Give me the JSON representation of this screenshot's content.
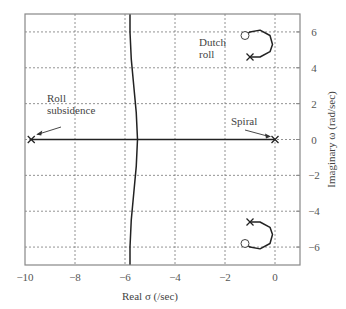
{
  "chart_data": {
    "type": "line",
    "title": "",
    "xlabel": "Real σ (/sec)",
    "ylabel": "Imaginary ω (rad/sec)",
    "xlim": [
      -10,
      1
    ],
    "ylim": [
      -7,
      7
    ],
    "grid": true,
    "x_ticks": [
      -10,
      -8,
      -6,
      -4,
      -2,
      0
    ],
    "x_tick_labels": [
      "−10",
      "−8",
      "−6",
      "−4",
      "−2",
      "0"
    ],
    "y_ticks": [
      -6,
      -4,
      -2,
      0,
      2,
      4,
      6
    ],
    "y_tick_labels": [
      "−6",
      "−4",
      "−2",
      "0",
      "2",
      "4",
      "6"
    ],
    "y_axis_side": "right",
    "series": [
      {
        "name": "real-axis-locus",
        "points": [
          [
            -9.75,
            0
          ],
          [
            0,
            0
          ]
        ]
      },
      {
        "name": "far-left-branch-upper",
        "points": [
          [
            -5.5,
            0
          ],
          [
            -5.55,
            1.5
          ],
          [
            -5.65,
            3
          ],
          [
            -5.75,
            4.5
          ],
          [
            -5.8,
            6
          ],
          [
            -5.8,
            7
          ]
        ]
      },
      {
        "name": "far-left-branch-lower",
        "points": [
          [
            -5.5,
            0
          ],
          [
            -5.55,
            -1.5
          ],
          [
            -5.65,
            -3
          ],
          [
            -5.75,
            -4.5
          ],
          [
            -5.8,
            -6
          ],
          [
            -5.8,
            -7
          ]
        ]
      },
      {
        "name": "dutch-roll-upper",
        "points": [
          [
            -1.0,
            4.6
          ],
          [
            -0.6,
            4.6
          ],
          [
            -0.2,
            4.9
          ],
          [
            -0.1,
            5.3
          ],
          [
            -0.2,
            5.8
          ],
          [
            -0.6,
            6.1
          ],
          [
            -1.0,
            6.0
          ],
          [
            -1.15,
            5.85
          ]
        ]
      },
      {
        "name": "dutch-roll-lower",
        "points": [
          [
            -1.0,
            -4.6
          ],
          [
            -0.6,
            -4.6
          ],
          [
            -0.2,
            -4.9
          ],
          [
            -0.1,
            -5.3
          ],
          [
            -0.2,
            -5.8
          ],
          [
            -0.6,
            -6.1
          ],
          [
            -1.0,
            -6.0
          ],
          [
            -1.15,
            -5.85
          ]
        ]
      }
    ],
    "poles": [
      [
        -9.75,
        0
      ],
      [
        0,
        0
      ],
      [
        -1.0,
        4.6
      ],
      [
        -1.0,
        -4.6
      ]
    ],
    "zeros": [
      [
        -1.2,
        5.8
      ],
      [
        -1.2,
        -5.8
      ]
    ],
    "annotations": [
      {
        "text_lines": [
          "Roll",
          "subsidence"
        ],
        "target": [
          -9.75,
          0
        ]
      },
      {
        "text_lines": [
          "Spiral"
        ],
        "target": [
          0,
          0
        ]
      },
      {
        "text_lines": [
          "Dutch",
          "roll"
        ],
        "target": [
          -1.0,
          5.3
        ]
      }
    ]
  }
}
